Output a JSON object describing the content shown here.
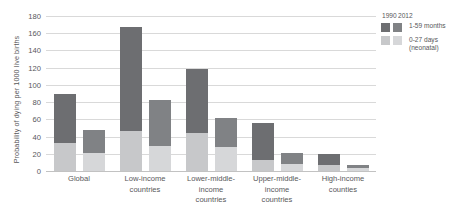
{
  "chart_data": {
    "type": "bar",
    "subtype": "grouped-stacked",
    "title": "",
    "xlabel": "",
    "ylabel": "Probability of dying per 1000 live births",
    "ylim": [
      0,
      180
    ],
    "y_ticks": [
      180,
      160,
      140,
      120,
      100,
      80,
      60,
      40,
      20,
      0
    ],
    "grid": true,
    "legend_position": "right",
    "categories": [
      "Global",
      "Low-income countries",
      "Lower-middle-income countries",
      "Upper-middle-income countries",
      "High-income counties"
    ],
    "groups": [
      "1990",
      "2012"
    ],
    "stack_order": [
      "0-27 days (neonatal)",
      "1-59 months"
    ],
    "series": [
      {
        "name": "1990 — 0-27 days (neonatal)",
        "year": "1990",
        "segment": "0-27 days (neonatal)",
        "values": [
          33,
          47,
          44,
          13,
          7
        ]
      },
      {
        "name": "1990 — 1-59 months",
        "year": "1990",
        "segment": "1-59 months",
        "values": [
          57,
          120,
          75,
          43,
          13
        ]
      },
      {
        "name": "2012 — 0-27 days (neonatal)",
        "year": "2012",
        "segment": "0-27 days (neonatal)",
        "values": [
          21,
          29,
          28,
          8,
          4
        ]
      },
      {
        "name": "2012 — 1-59 months",
        "year": "2012",
        "segment": "1-59 months",
        "values": [
          27,
          53,
          34,
          13,
          3
        ]
      }
    ],
    "totals": {
      "1990": [
        90,
        167,
        119,
        56,
        20
      ],
      "2012": [
        48,
        82,
        62,
        21,
        7
      ]
    }
  },
  "axis": {
    "y_title": "Probability of dying per 1000 live births",
    "y_ticks": [
      "180",
      "160",
      "140",
      "120",
      "100",
      "80",
      "60",
      "40",
      "20",
      "0"
    ]
  },
  "x_labels": [
    {
      "line1": "Global",
      "line2": ""
    },
    {
      "line1": "Low-income",
      "line2": "countries"
    },
    {
      "line1": "Lower-middle-income",
      "line2": "countries"
    },
    {
      "line1": "Upper-middle-income",
      "line2": "countries"
    },
    {
      "line1": "High-income",
      "line2": "counties"
    }
  ],
  "legend": {
    "year_1990": "1990",
    "year_2012": "2012",
    "rows": [
      {
        "line1": "1-59 months",
        "line2": ""
      },
      {
        "line1": "0-27 days",
        "line2": "(neonatal)"
      }
    ]
  },
  "colors": {
    "upper_1990": "#6d6e71",
    "upper_2012": "#808285",
    "lower_1990": "#c7c8ca",
    "lower_2012": "#d6d7d9",
    "grid": "#d9d9d9",
    "text": "#58585a",
    "background": "#ffffff"
  }
}
